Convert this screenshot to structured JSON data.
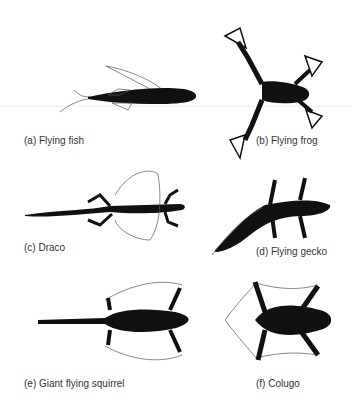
{
  "figure": {
    "panels": [
      {
        "id": "a",
        "label": "(a) Flying fish"
      },
      {
        "id": "b",
        "label": "(b) Flying frog"
      },
      {
        "id": "c",
        "label": "(c) Draco"
      },
      {
        "id": "d",
        "label": "(d) Flying gecko"
      },
      {
        "id": "e",
        "label": "(e) Giant flying squirrel"
      },
      {
        "id": "f",
        "label": "(f) Colugo"
      }
    ],
    "colors": {
      "silhouette": "#111111",
      "outline": "#555555",
      "text": "#333333"
    }
  }
}
